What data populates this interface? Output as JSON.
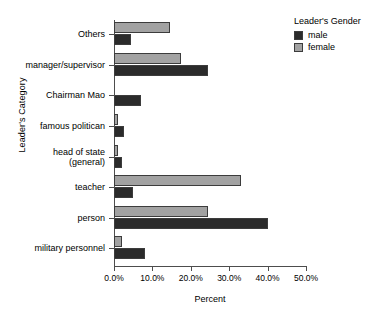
{
  "chart_data": {
    "type": "bar",
    "orientation": "horizontal",
    "title": "",
    "xlabel": "Percent",
    "ylabel": "Leader's Category",
    "xlim": [
      0,
      50
    ],
    "xticks": [
      "0.0%",
      "10.0%",
      "20.0%",
      "30.0%",
      "40.0%",
      "50.0%"
    ],
    "xtick_values": [
      0,
      10,
      20,
      30,
      40,
      50
    ],
    "grid": false,
    "legend_position": "top-right",
    "legend_title": "Leader's Gender",
    "categories": [
      "Others",
      "manager/supervisor",
      "Chairman Mao",
      "famous politican",
      "head of state\n(general)",
      "teacher",
      "person",
      "military personnel"
    ],
    "series": [
      {
        "name": "male",
        "color": "#2b2b2b",
        "values": [
          4.5,
          24.5,
          7.0,
          2.5,
          2.0,
          5.0,
          40.0,
          8.0
        ]
      },
      {
        "name": "female",
        "color": "#a2a2a2",
        "values": [
          14.5,
          17.5,
          0.0,
          1.0,
          1.0,
          33.0,
          24.5,
          2.0
        ]
      }
    ]
  }
}
